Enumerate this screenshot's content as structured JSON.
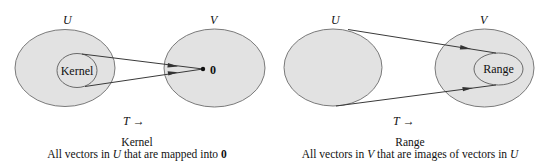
{
  "kernel_panel": {
    "domain_label": "U",
    "codomain_label": "V",
    "subset_label": "Kernel",
    "target_label": "0",
    "map_label": "T",
    "map_arrow": "→",
    "caption_title": "Kernel",
    "caption_desc_pre": "All vectors in ",
    "caption_desc_var": "U",
    "caption_desc_mid": " that are mapped into ",
    "caption_desc_zero": "0"
  },
  "range_panel": {
    "domain_label": "U",
    "codomain_label": "V",
    "subset_label": "Range",
    "map_label": "T",
    "map_arrow": "→",
    "caption_title": "Range",
    "caption_desc_pre": "All vectors in ",
    "caption_desc_var1": "V",
    "caption_desc_mid": " that are images of vectors in ",
    "caption_desc_var2": "U"
  },
  "colors": {
    "set_fill": "#e2e2e2",
    "set_stroke": "#7a7a7a",
    "line": "#3a3a3a"
  }
}
